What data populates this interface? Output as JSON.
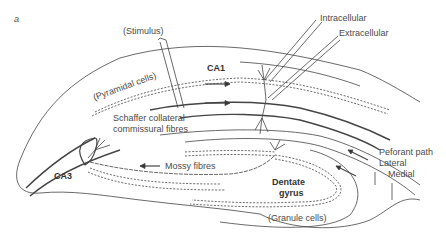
{
  "figure": {
    "panel_label": "a"
  },
  "labels": {
    "stimulus": "(Stimulus)",
    "ca1": "CA1",
    "pyramidal_cells": "(Pyramidal cells)",
    "schaffer_line1": "Schaffer collateral",
    "schaffer_line2": "commissural fibres",
    "intracellular": "Intracellular",
    "extracellular": "Extracellular",
    "ca3": "CA3",
    "mossy_fibres": "Mossy fibres",
    "dentate_line1": "Dentate",
    "dentate_line2": "gyrus",
    "granule_cells": "(Granule cells)",
    "perforant_path": "Peforant path",
    "lateral": "Lateral",
    "medial": "Medial"
  },
  "colors": {
    "line": "#333333",
    "text": "#4a4a4a"
  }
}
